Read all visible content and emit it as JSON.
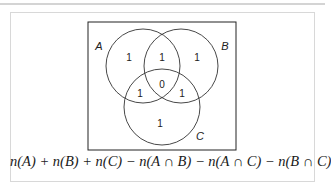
{
  "diagram": {
    "type": "venn-3-set",
    "sets": [
      {
        "label": "A",
        "cx": 143,
        "cy": 66,
        "r": 37
      },
      {
        "label": "B",
        "cx": 181,
        "cy": 66,
        "r": 37
      },
      {
        "label": "C",
        "cx": 162,
        "cy": 107,
        "r": 38
      }
    ],
    "regions": {
      "A_only": "1",
      "A_and_B_only": "1",
      "B_only": "1",
      "A_and_C_only": "1",
      "A_and_B_and_C": "0",
      "B_and_C_only": "1",
      "C_only": "1"
    },
    "labels": {
      "A": "A",
      "B": "B",
      "C": "C"
    },
    "formula": "n(A) + n(B) + n(C) − n(A ∩ B) − n(A ∩ C) − n(B ∩ C)"
  }
}
